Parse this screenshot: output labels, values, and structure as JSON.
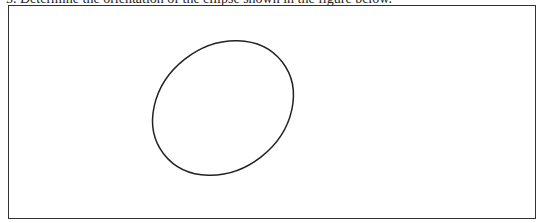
{
  "header": {
    "clipped_question_text": "5.  Determine the orientation of the ellipse shown in the figure below."
  },
  "figure": {
    "shape": "ellipse",
    "stroke_color": "#222222",
    "border_color": "#333333"
  }
}
